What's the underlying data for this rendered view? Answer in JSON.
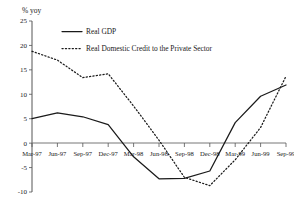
{
  "chart_data": {
    "type": "line",
    "title": "",
    "ylabel": "% yoy",
    "xlabel": "",
    "ylim": [
      -10,
      25
    ],
    "yticks": [
      25,
      20,
      15,
      10,
      5,
      0,
      -5,
      -10
    ],
    "ytick_labels": [
      "25",
      "20",
      "15",
      "10",
      "5",
      "0",
      "-5",
      "-10"
    ],
    "grid": false,
    "legend_position": "top-left-inside",
    "categories": [
      "Mar-97",
      "Jun-97",
      "Sep-97",
      "Dec-97",
      "Mar-98",
      "Jun-98",
      "Sep-98",
      "Dec-98",
      "Mar-99",
      "Jun-99",
      "Sep-99"
    ],
    "series": [
      {
        "name": "Real GDP",
        "style": "solid",
        "values": [
          5.0,
          6.2,
          5.4,
          3.8,
          -2.8,
          -7.3,
          -7.2,
          -5.7,
          4.2,
          9.6,
          11.9
        ]
      },
      {
        "name": "Real Domestic Credit to the Private Sector",
        "style": "dotted",
        "values": [
          18.8,
          17.0,
          13.4,
          14.2,
          7.6,
          0.6,
          -7.0,
          -8.7,
          -3.4,
          3.2,
          13.7
        ]
      }
    ]
  },
  "legend": {
    "entries": [
      {
        "label": "Real GDP",
        "style": "solid"
      },
      {
        "label": "Real Domestic Credit to the Private Sector",
        "style": "dotted"
      }
    ]
  }
}
